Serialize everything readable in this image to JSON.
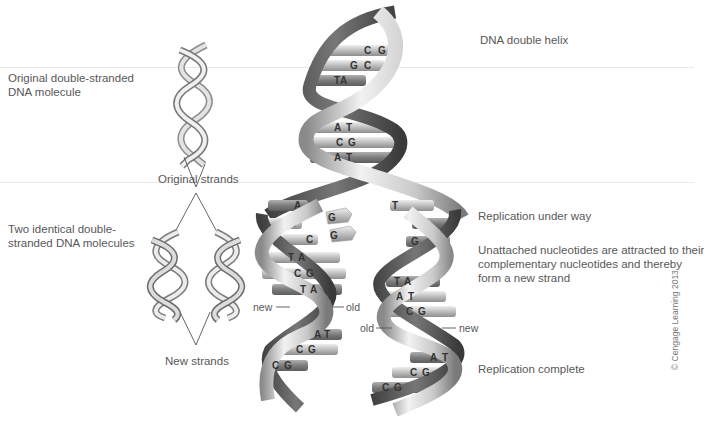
{
  "figure": {
    "copyright": "© Cengage Learning 2013"
  },
  "left_labels": {
    "original_molecule": [
      "Original double-stranded",
      "DNA molecule"
    ],
    "original_strands": "Original strands",
    "two_identical": [
      "Two identical double-",
      "stranded DNA molecules"
    ],
    "new_strands": "New strands"
  },
  "right_labels": {
    "double_helix": "DNA double helix",
    "replication_under_way": "Replication under way",
    "unattached": [
      "Unattached nucleotides are attracted to their",
      "complementary nucleotides and thereby",
      "form a new strand"
    ],
    "replication_complete": "Replication complete"
  },
  "strand_labels": {
    "left_new": "new",
    "left_old": "old",
    "right_old": "old",
    "right_new": "new"
  },
  "base_pairs": {
    "parent_top": [
      {
        "left": "C",
        "right": "G"
      },
      {
        "left": "G",
        "right": "C"
      },
      {
        "left": "T",
        "right": "A"
      }
    ],
    "parent_middle": [
      {
        "left": "A",
        "right": "T"
      },
      {
        "left": "C",
        "right": "G"
      },
      {
        "left": "A",
        "right": "T"
      }
    ],
    "unpaired_left_strand": [
      "A",
      "C",
      "C"
    ],
    "unpaired_right_strand": [
      "T",
      "G",
      "G"
    ],
    "free_nucleotides": [
      "G",
      "G"
    ],
    "daughter_left_upper": [
      {
        "left": "T",
        "right": "A"
      },
      {
        "left": "C",
        "right": "G"
      },
      {
        "left": "T",
        "right": "A"
      }
    ],
    "daughter_left_lower": [
      {
        "left": "A",
        "right": "T"
      },
      {
        "left": "C",
        "right": "G"
      },
      {
        "left": "C",
        "right": "G"
      }
    ],
    "daughter_right_upper": [
      {
        "left": "T",
        "right": "A"
      },
      {
        "left": "A",
        "right": "T"
      },
      {
        "left": "C",
        "right": "G"
      }
    ],
    "daughter_right_lower": [
      {
        "left": "A",
        "right": "T"
      },
      {
        "left": "C",
        "right": "G"
      },
      {
        "left": "C",
        "right": "G"
      }
    ]
  },
  "colors": {
    "ribbon_light": "#e6e6e6",
    "ribbon_mid": "#b5b5b5",
    "ribbon_dark": "#5a5a5a",
    "bar_light": "#d4d4d4",
    "bar_dark": "#8c8c8c",
    "text": "#585858",
    "line": "#555555"
  }
}
